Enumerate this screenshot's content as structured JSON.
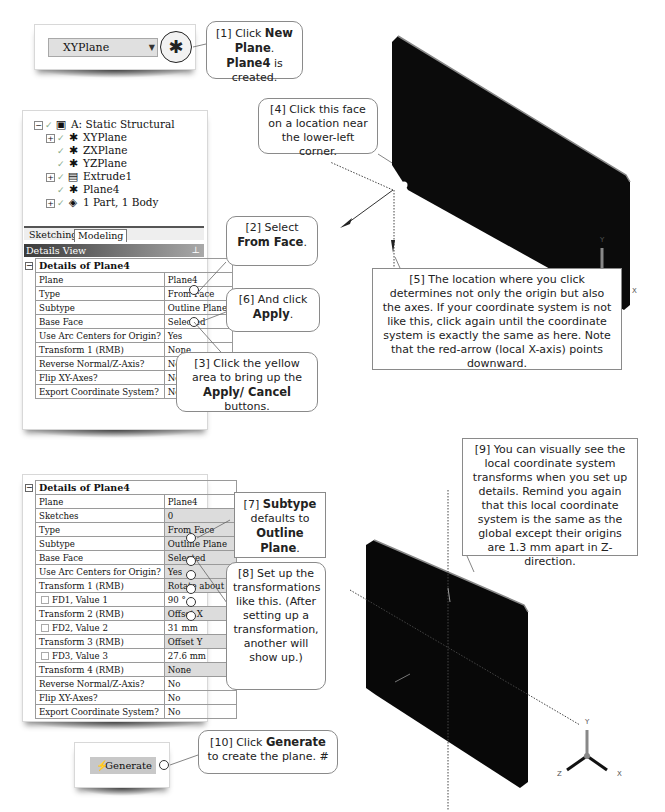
{
  "toolbar": {
    "plane_select_value": "XYPlane",
    "dropdown_icon": "chevron-down-icon",
    "new_plane_icon": "new-plane-icon"
  },
  "tree": {
    "root": "A: Static Structural",
    "items": [
      {
        "label": "XYPlane",
        "expandable": true,
        "icon": "plane-icon"
      },
      {
        "label": "ZXPlane",
        "expandable": false,
        "icon": "plane-icon"
      },
      {
        "label": "YZPlane",
        "expandable": false,
        "icon": "plane-icon"
      },
      {
        "label": "Extrude1",
        "expandable": true,
        "icon": "extrude-icon"
      },
      {
        "label": "Plane4",
        "expandable": false,
        "icon": "plane-icon"
      },
      {
        "label": "1 Part, 1 Body",
        "expandable": true,
        "icon": "body-icon"
      }
    ]
  },
  "tabs": [
    {
      "label": "Sketching",
      "active": false
    },
    {
      "label": "Modeling",
      "active": true
    }
  ],
  "details_view": {
    "header": "Details View",
    "title": "Details of Plane4",
    "rows": [
      {
        "key": "Plane",
        "value": "Plane4"
      },
      {
        "key": "Type",
        "value": "From Face"
      },
      {
        "key": "Subtype",
        "value": "Outline Plane"
      },
      {
        "key": "Base Face",
        "value": "Selected"
      },
      {
        "key": "Use Arc Centers for Origin?",
        "value": "Yes"
      },
      {
        "key": "Transform 1 (RMB)",
        "value": "None"
      },
      {
        "key": "Reverse Normal/Z-Axis?",
        "value": "No"
      },
      {
        "key": "Flip XY-Axes?",
        "value": "No"
      },
      {
        "key": "Export Coordinate System?",
        "value": "No"
      }
    ]
  },
  "details_view_2": {
    "title": "Details of Plane4",
    "rows": [
      {
        "key": "Plane",
        "value": "Plane4"
      },
      {
        "key": "Sketches",
        "value": "0"
      },
      {
        "key": "Type",
        "value": "From Face"
      },
      {
        "key": "Subtype",
        "value": "Outline Plane"
      },
      {
        "key": "Base Face",
        "value": "Selected"
      },
      {
        "key": "Use Arc Centers for Origin?",
        "value": "Yes"
      },
      {
        "key": "Transform 1 (RMB)",
        "value": "Rotate about Z"
      },
      {
        "key": "FD1, Value 1",
        "value": "90 °"
      },
      {
        "key": "Transform 2 (RMB)",
        "value": "Offset X"
      },
      {
        "key": "FD2, Value 2",
        "value": "31 mm"
      },
      {
        "key": "Transform 3 (RMB)",
        "value": "Offset Y"
      },
      {
        "key": "FD3, Value 3",
        "value": "27.6 mm"
      },
      {
        "key": "Transform 4 (RMB)",
        "value": "None"
      },
      {
        "key": "Reverse Normal/Z-Axis?",
        "value": "No"
      },
      {
        "key": "Flip XY-Axes?",
        "value": "No"
      },
      {
        "key": "Export Coordinate System?",
        "value": "No"
      }
    ]
  },
  "generate_button": {
    "label": "Generate",
    "icon": "generate-bolt-icon"
  },
  "callouts": {
    "c1": {
      "pre": "[1] Click ",
      "b1": "New Plane",
      "mid": ". ",
      "b2": "Plane4",
      "post": " is created."
    },
    "c2": {
      "pre": "[2] Select ",
      "b1": "From Face",
      "post": "."
    },
    "c3": {
      "pre": "[3] Click the yellow area to bring up the ",
      "b1": "Apply/ Cancel",
      "post": " buttons."
    },
    "c4": {
      "text": "[4] Click this face on a location near the lower-left corner."
    },
    "c5": {
      "text": "[5] The location where you click determines not only the origin but also the axes.  If your coordinate system is not like this, click again until the coordinate system is exactly the same as here.  Note that the red-arrow (local X-axis) points downward."
    },
    "c6": {
      "pre": "[6] And click ",
      "b1": "Apply",
      "post": "."
    },
    "c7": {
      "pre": "[7] ",
      "b1": "Subtype",
      "mid": " defaults to ",
      "b2": "Outline Plane",
      "post": "."
    },
    "c8": {
      "text": "[8] Set up the transformations like this. (After setting up a transformation, another will show up.)"
    },
    "c9": {
      "text": "[9] You can visually see the local coordinate system transforms when you set up details.  Remind you again that this local coordinate system is the same as the global except their origins are 1.3 mm apart in Z-direction."
    },
    "c10": {
      "pre": "[10] Click ",
      "b1": "Generate",
      "post": " to create the plane. #"
    }
  },
  "triad": {
    "x": "X",
    "y": "Y",
    "z": "Z"
  }
}
